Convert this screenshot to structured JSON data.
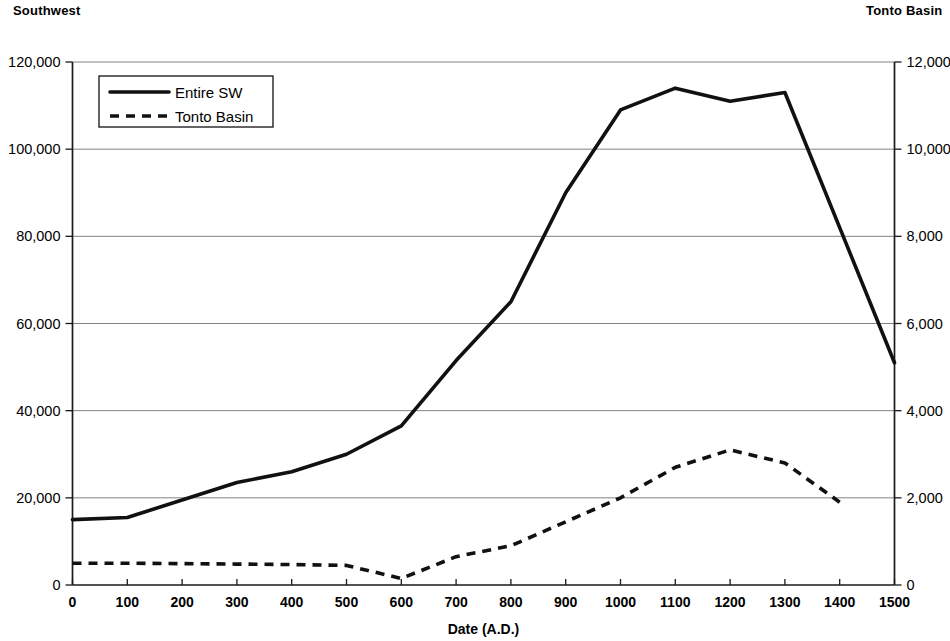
{
  "header": {
    "left_label": "Southwest",
    "right_label": "Tonto Basin"
  },
  "axes": {
    "x_title": "Date (A.D.)",
    "x_ticks": [
      "0",
      "100",
      "200",
      "300",
      "400",
      "500",
      "600",
      "700",
      "800",
      "900",
      "1000",
      "1100",
      "1200",
      "1300",
      "1400",
      "1500"
    ],
    "y_left_ticks": [
      "0",
      "20,000",
      "40,000",
      "60,000",
      "80,000",
      "100,000",
      "120,000"
    ],
    "y_right_ticks": [
      "0",
      "2,000",
      "4,000",
      "6,000",
      "8,000",
      "10,000",
      "12,000"
    ]
  },
  "legend": {
    "items": [
      {
        "label": "Entire SW",
        "style": "solid"
      },
      {
        "label": "Tonto Basin",
        "style": "dashed"
      }
    ]
  },
  "chart_data": {
    "type": "line",
    "title": "",
    "subtitle": "",
    "xlabel": "Date (A.D.)",
    "ylabel": "Southwest",
    "y2label": "Tonto Basin",
    "xlim": [
      0,
      1500
    ],
    "ylim": [
      0,
      120000
    ],
    "y2lim": [
      0,
      12000
    ],
    "xticks": [
      0,
      100,
      200,
      300,
      400,
      500,
      600,
      700,
      800,
      900,
      1000,
      1100,
      1200,
      1300,
      1400,
      1500
    ],
    "yticks": [
      0,
      20000,
      40000,
      60000,
      80000,
      100000,
      120000
    ],
    "y2ticks": [
      0,
      2000,
      4000,
      6000,
      8000,
      10000,
      12000
    ],
    "grid": true,
    "grid_axis": "y",
    "legend_position": "upper-left",
    "series": [
      {
        "name": "Entire SW",
        "axis": "left",
        "style": "solid",
        "color": "#111111",
        "x": [
          0,
          100,
          200,
          300,
          400,
          500,
          600,
          700,
          800,
          900,
          1000,
          1100,
          1200,
          1300,
          1400,
          1500
        ],
        "values": [
          15000,
          15500,
          19500,
          23500,
          26000,
          30000,
          36500,
          51500,
          65000,
          90000,
          109000,
          114000,
          111000,
          113000,
          82000,
          51000
        ]
      },
      {
        "name": "Tonto Basin",
        "axis": "right",
        "style": "dashed",
        "color": "#111111",
        "x": [
          0,
          100,
          200,
          300,
          400,
          500,
          600,
          700,
          800,
          900,
          1000,
          1100,
          1200,
          1300,
          1400
        ],
        "values": [
          500,
          500,
          490,
          480,
          470,
          450,
          150,
          650,
          900,
          1450,
          2000,
          2700,
          3100,
          2800,
          1900
        ]
      }
    ]
  }
}
